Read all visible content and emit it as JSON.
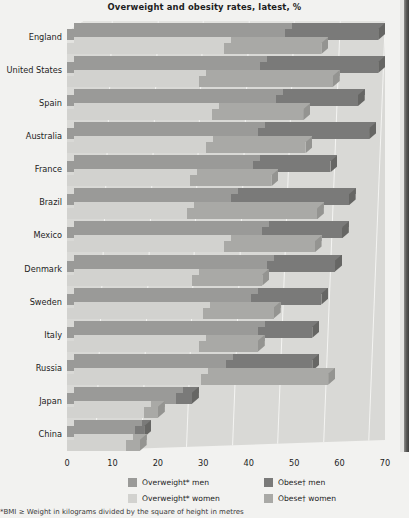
{
  "chart": {
    "title": "Overweight and obesity rates, latest, %",
    "footnote": "*BMI ≥ Weight in kilograms divided by the square of height in metres"
  },
  "axis": {
    "ticks": [
      "0",
      "10",
      "20",
      "30",
      "40",
      "50",
      "60",
      "70"
    ],
    "xlim_min": 0,
    "xlim_max": 70
  },
  "legend": {
    "items": [
      {
        "label": "Overweight* men",
        "color": "#9a9a98"
      },
      {
        "label": "Obese† men",
        "color": "#7a7a79"
      },
      {
        "label": "Overweight* women",
        "color": "#d2d2cf"
      },
      {
        "label": "Obese† women",
        "color": "#a9a9a6"
      }
    ]
  },
  "chart_data": {
    "type": "bar",
    "subtype": "stacked-horizontal-3d",
    "title": "Overweight and obesity rates, latest, %",
    "xlabel": "",
    "ylabel": "",
    "xlim": [
      0,
      70
    ],
    "grid": true,
    "legend_position": "bottom",
    "categories": [
      "England",
      "United States",
      "Spain",
      "Australia",
      "France",
      "Brazil",
      "Mexico",
      "Denmark",
      "Sweden",
      "Italy",
      "Russia",
      "Japan",
      "China"
    ],
    "series": [
      {
        "name": "Overweight* men",
        "values": [
          48.0,
          42.5,
          46.0,
          42.0,
          41.0,
          36.0,
          43.0,
          44.0,
          40.5,
          42.0,
          35.0,
          24.0,
          15.0
        ]
      },
      {
        "name": "Obese† men",
        "values": [
          20.5,
          26.0,
          18.0,
          24.5,
          17.0,
          26.0,
          17.5,
          15.0,
          15.5,
          12.0,
          19.0,
          3.5,
          2.0
        ]
      },
      {
        "name": "Overweight* women",
        "values": [
          34.5,
          29.0,
          32.0,
          30.5,
          27.0,
          26.5,
          34.5,
          27.5,
          30.0,
          29.0,
          29.5,
          17.0,
          13.0
        ]
      },
      {
        "name": "Obese† women",
        "values": [
          21.5,
          29.5,
          20.0,
          22.0,
          18.0,
          28.5,
          20.0,
          15.5,
          15.5,
          13.0,
          28.0,
          3.0,
          3.0
        ]
      }
    ],
    "rows": [
      {
        "country": "England",
        "men": {
          "overweight": 48.0,
          "obese": 20.5,
          "total": 68.5
        },
        "women": {
          "overweight": 34.5,
          "obese": 21.5,
          "total": 56.0
        }
      },
      {
        "country": "United States",
        "men": {
          "overweight": 42.5,
          "obese": 26.0,
          "total": 68.5
        },
        "women": {
          "overweight": 29.0,
          "obese": 29.5,
          "total": 58.5
        }
      },
      {
        "country": "Spain",
        "men": {
          "overweight": 46.0,
          "obese": 18.0,
          "total": 64.0
        },
        "women": {
          "overweight": 32.0,
          "obese": 20.0,
          "total": 52.0
        }
      },
      {
        "country": "Australia",
        "men": {
          "overweight": 42.0,
          "obese": 24.5,
          "total": 66.5
        },
        "women": {
          "overweight": 30.5,
          "obese": 22.0,
          "total": 52.5
        }
      },
      {
        "country": "France",
        "men": {
          "overweight": 41.0,
          "obese": 17.0,
          "total": 58.0
        },
        "women": {
          "overweight": 27.0,
          "obese": 18.0,
          "total": 45.0
        }
      },
      {
        "country": "Brazil",
        "men": {
          "overweight": 36.0,
          "obese": 26.0,
          "total": 62.0
        },
        "women": {
          "overweight": 26.5,
          "obese": 28.5,
          "total": 55.0
        }
      },
      {
        "country": "Mexico",
        "men": {
          "overweight": 43.0,
          "obese": 17.5,
          "total": 60.5
        },
        "women": {
          "overweight": 34.5,
          "obese": 20.0,
          "total": 54.5
        }
      },
      {
        "country": "Denmark",
        "men": {
          "overweight": 44.0,
          "obese": 15.0,
          "total": 59.0
        },
        "women": {
          "overweight": 27.5,
          "obese": 15.5,
          "total": 43.0
        }
      },
      {
        "country": "Sweden",
        "men": {
          "overweight": 40.5,
          "obese": 15.5,
          "total": 56.0
        },
        "women": {
          "overweight": 30.0,
          "obese": 15.5,
          "total": 45.5
        }
      },
      {
        "country": "Italy",
        "men": {
          "overweight": 42.0,
          "obese": 12.0,
          "total": 54.0
        },
        "women": {
          "overweight": 29.0,
          "obese": 13.0,
          "total": 42.0
        }
      },
      {
        "country": "Russia",
        "men": {
          "overweight": 35.0,
          "obese": 19.0,
          "total": 54.0
        },
        "women": {
          "overweight": 29.5,
          "obese": 28.0,
          "total": 57.5
        }
      },
      {
        "country": "Japan",
        "men": {
          "overweight": 24.0,
          "obese": 3.5,
          "total": 27.5
        },
        "women": {
          "overweight": 17.0,
          "obese": 3.0,
          "total": 20.0
        }
      },
      {
        "country": "China",
        "men": {
          "overweight": 15.0,
          "obese": 2.0,
          "total": 17.0
        },
        "women": {
          "overweight": 13.0,
          "obese": 3.0,
          "total": 16.0
        }
      }
    ]
  }
}
